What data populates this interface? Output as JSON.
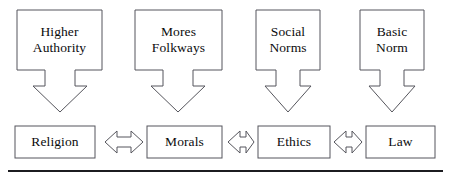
{
  "diagram": {
    "background_color": "#ffffff",
    "outline_color": "#55555c",
    "text_color": "#0b0b0d",
    "rule_color": "#1c1c20",
    "sources": [
      {
        "id": "higher-authority",
        "line1": "Higher",
        "line2": "Authority"
      },
      {
        "id": "mores-folkways",
        "line1": "Mores",
        "line2": "Folkways"
      },
      {
        "id": "social-norms",
        "line1": "Social",
        "line2": "Norms"
      },
      {
        "id": "basic-norm",
        "line1": "Basic",
        "line2": "Norm"
      }
    ],
    "outcomes": [
      {
        "id": "religion",
        "label": "Religion"
      },
      {
        "id": "morals",
        "label": "Morals"
      },
      {
        "id": "ethics",
        "label": "Ethics"
      },
      {
        "id": "law",
        "label": "Law"
      }
    ],
    "down_arrows": [
      {
        "id": "arrow-down-religion",
        "from": "higher-authority",
        "to": "religion",
        "direction": "down"
      },
      {
        "id": "arrow-down-morals",
        "from": "mores-folkways",
        "to": "morals",
        "direction": "down"
      },
      {
        "id": "arrow-down-ethics",
        "from": "social-norms",
        "to": "ethics",
        "direction": "down"
      },
      {
        "id": "arrow-down-law",
        "from": "basic-norm",
        "to": "law",
        "direction": "down"
      }
    ],
    "link_arrows": [
      {
        "id": "arrow-religion-morals",
        "left": "religion",
        "right": "morals",
        "direction": "both"
      },
      {
        "id": "arrow-morals-ethics",
        "left": "morals",
        "right": "ethics",
        "direction": "both"
      },
      {
        "id": "arrow-ethics-law",
        "left": "ethics",
        "right": "law",
        "direction": "both"
      }
    ],
    "footer_rule": {
      "id": "footer-rule",
      "visible": "true"
    }
  }
}
